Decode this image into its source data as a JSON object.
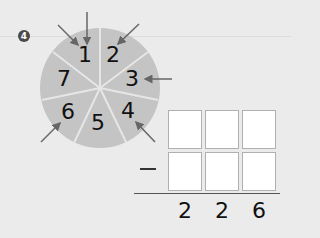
{
  "problem": {
    "number": "4",
    "dartboard": {
      "sectors": [
        "1",
        "2",
        "3",
        "4",
        "5",
        "6",
        "7"
      ],
      "arrows_hit": [
        "1",
        "1",
        "2",
        "3",
        "4",
        "6"
      ],
      "colors": {
        "board": "#c4c4c4",
        "divider": "#e6e6e6",
        "arrow": "#666666"
      }
    },
    "subtraction": {
      "operator": "−",
      "top_row": [
        "",
        "",
        ""
      ],
      "bottom_row": [
        "",
        "",
        ""
      ],
      "result": [
        "2",
        "2",
        "6"
      ]
    }
  }
}
